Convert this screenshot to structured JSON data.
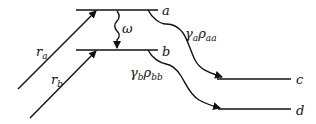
{
  "diagram": {
    "levels": [
      {
        "id": "a",
        "label": "a"
      },
      {
        "id": "b",
        "label": "b"
      },
      {
        "id": "c",
        "label": "c"
      },
      {
        "id": "d",
        "label": "d"
      }
    ],
    "pump_a": {
      "symbol": "r",
      "subscript": "a"
    },
    "pump_b": {
      "symbol": "r",
      "subscript": "b"
    },
    "coupling": {
      "symbol": "ω"
    },
    "decay_a": {
      "gamma": "γ",
      "gamma_sub": "a",
      "rho": "ρ",
      "rho_sub": "aa"
    },
    "decay_b": {
      "gamma": "γ",
      "gamma_sub": "b",
      "rho": "ρ",
      "rho_sub": "bb"
    },
    "colors": {
      "stroke": "#111111",
      "background": "#ffffff"
    }
  }
}
